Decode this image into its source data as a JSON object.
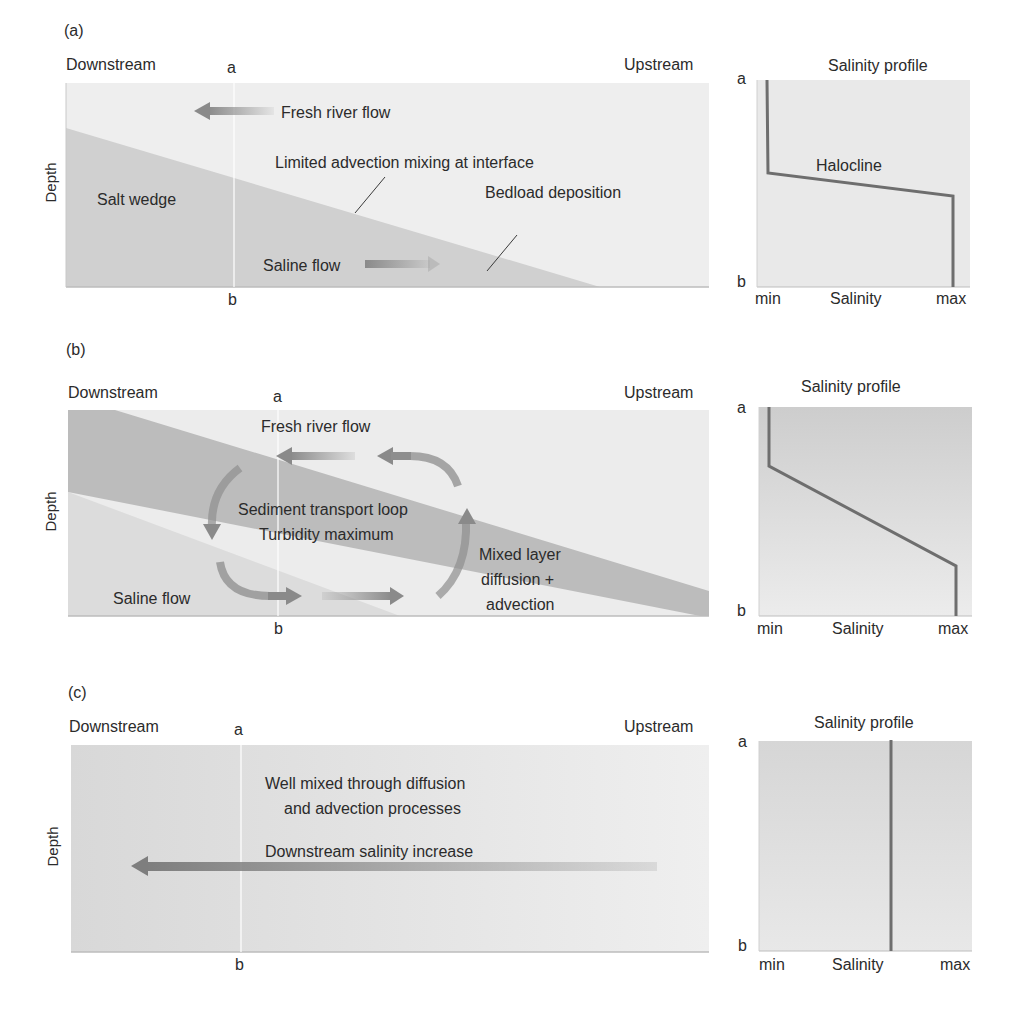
{
  "panels": [
    {
      "id": "a",
      "letter": "(a)",
      "downstream": "Downstream",
      "upstream": "Upstream",
      "depth_label": "Depth",
      "section_top": "a",
      "section_bottom": "b",
      "labels": {
        "fresh_flow": "Fresh river flow",
        "interface": "Limited advection mixing at interface",
        "salt_wedge": "Salt wedge",
        "bedload": "Bedload deposition",
        "saline_flow": "Saline flow"
      },
      "profile": {
        "title": "Salinity profile",
        "top": "a",
        "bottom": "b",
        "x_min": "min",
        "x_label": "Salinity",
        "x_max": "max",
        "annotation": "Halocline"
      }
    },
    {
      "id": "b",
      "letter": "(b)",
      "downstream": "Downstream",
      "upstream": "Upstream",
      "depth_label": "Depth",
      "section_top": "a",
      "section_bottom": "b",
      "labels": {
        "fresh_flow": "Fresh river flow",
        "loop_line1": "Sediment transport loop",
        "loop_line2": "Turbidity maximum",
        "mixed_line1": "Mixed layer",
        "mixed_line2": "diffusion +",
        "mixed_line3": "advection",
        "saline_flow": "Saline flow"
      },
      "profile": {
        "title": "Salinity profile",
        "top": "a",
        "bottom": "b",
        "x_min": "min",
        "x_label": "Salinity",
        "x_max": "max"
      }
    },
    {
      "id": "c",
      "letter": "(c)",
      "downstream": "Downstream",
      "upstream": "Upstream",
      "depth_label": "Depth",
      "section_top": "a",
      "section_bottom": "b",
      "labels": {
        "mixed_line1": "Well mixed through diffusion",
        "mixed_line2": "and advection processes",
        "gradient": "Downstream salinity increase"
      },
      "profile": {
        "title": "Salinity profile",
        "top": "a",
        "bottom": "b",
        "x_min": "min",
        "x_label": "Salinity",
        "x_max": "max"
      }
    }
  ],
  "colors": {
    "fresh": "#eeeeee",
    "saline": "#cfcfcf",
    "mixed_band": "#bdbdbd",
    "profile_line": "#6e6e6e",
    "arrow": "#8a8a8a"
  }
}
